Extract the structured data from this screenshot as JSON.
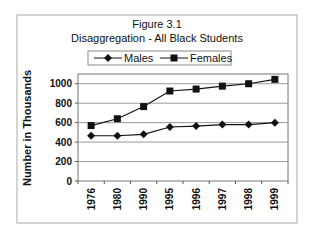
{
  "chart_data": {
    "type": "line",
    "title": "Figure 3.1",
    "subtitle": "Disaggregation - All Black Students",
    "xlabel": "",
    "ylabel": "Number in Thousands",
    "categories": [
      "1976",
      "1980",
      "1990",
      "1995",
      "1996",
      "1997",
      "1998",
      "1999"
    ],
    "series": [
      {
        "name": "Males",
        "marker": "diamond",
        "values": [
          465,
          465,
          480,
          555,
          565,
          580,
          580,
          600
        ]
      },
      {
        "name": "Females",
        "marker": "square",
        "values": [
          570,
          640,
          765,
          925,
          945,
          975,
          1000,
          1045
        ]
      }
    ],
    "ylim": [
      0,
      1100
    ],
    "yticks": [
      0,
      200,
      400,
      600,
      800,
      1000
    ],
    "ytick_labels": [
      "0",
      "200",
      "400",
      "600",
      "800",
      "1000"
    ],
    "grid": true,
    "legend": {
      "position": "top-center",
      "entries": [
        "Males",
        "Females"
      ]
    },
    "colors": {
      "line": "#111111",
      "grid": "#999999",
      "border": "#aaaaaa"
    }
  }
}
